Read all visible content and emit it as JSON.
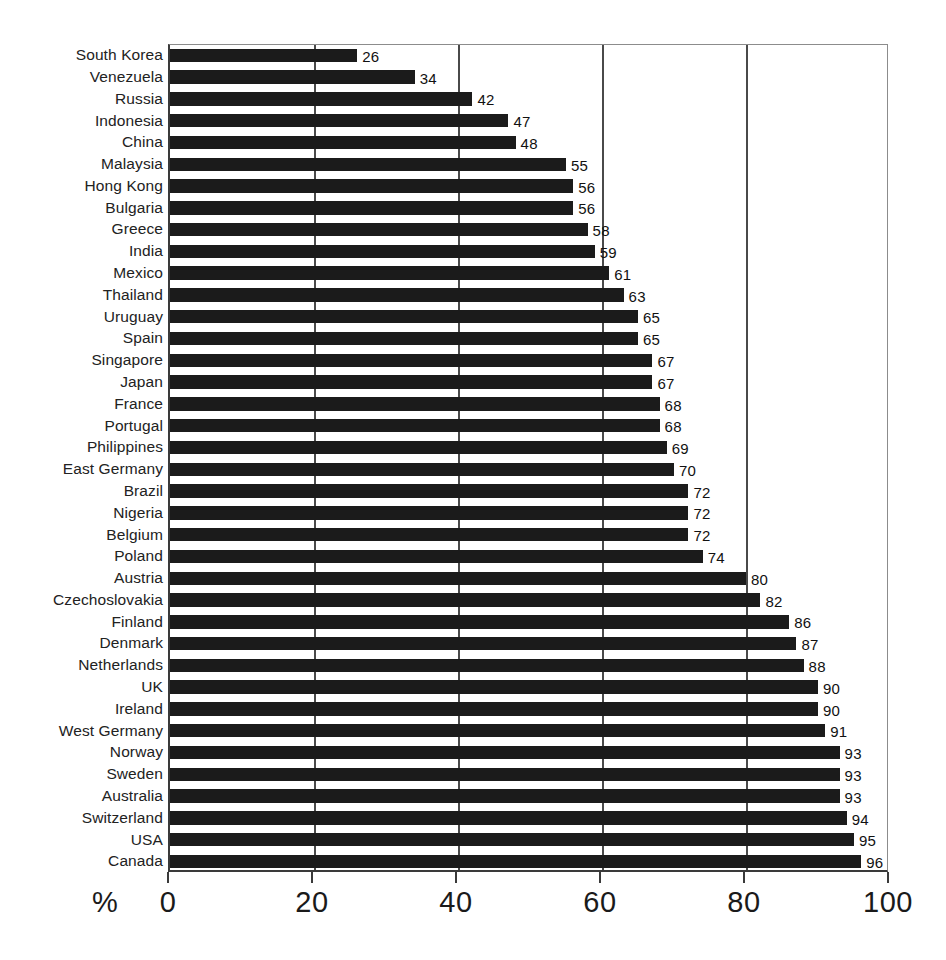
{
  "chart_data": {
    "type": "bar",
    "orientation": "horizontal",
    "title": "",
    "subtitle": "",
    "xlabel": "%",
    "ylabel": "",
    "xlim": [
      0,
      100
    ],
    "xticks": [
      "0",
      "20",
      "40",
      "60",
      "80",
      "100"
    ],
    "xtick_values": [
      0,
      20,
      40,
      60,
      80,
      100
    ],
    "gridlines": [
      20,
      40,
      60,
      80
    ],
    "grid": true,
    "legend": false,
    "legend_position": "none",
    "bar_color": "#1b1b1b",
    "value_labels": true,
    "categories": [
      "South Korea",
      "Venezuela",
      "Russia",
      "Indonesia",
      "China",
      "Malaysia",
      "Hong Kong",
      "Bulgaria",
      "Greece",
      "India",
      "Mexico",
      "Thailand",
      "Uruguay",
      "Spain",
      "Singapore",
      "Japan",
      "France",
      "Portugal",
      "Philippines",
      "East Germany",
      "Brazil",
      "Nigeria",
      "Belgium",
      "Poland",
      "Austria",
      "Czechoslovakia",
      "Finland",
      "Denmark",
      "Netherlands",
      "UK",
      "Ireland",
      "West Germany",
      "Norway",
      "Sweden",
      "Australia",
      "Switzerland",
      "USA",
      "Canada"
    ],
    "values": [
      26,
      34,
      42,
      47,
      48,
      55,
      56,
      56,
      58,
      59,
      61,
      63,
      65,
      65,
      67,
      67,
      68,
      68,
      69,
      70,
      72,
      72,
      72,
      74,
      80,
      82,
      86,
      87,
      88,
      90,
      90,
      91,
      93,
      93,
      93,
      94,
      95,
      96
    ]
  }
}
